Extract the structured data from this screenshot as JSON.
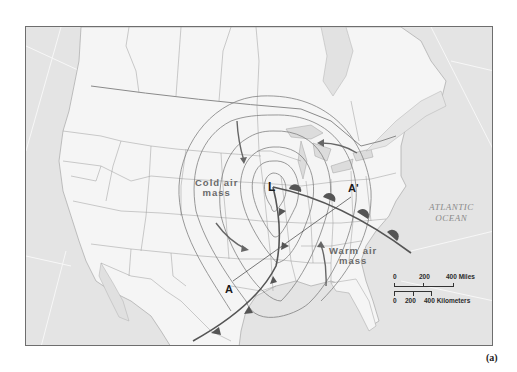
{
  "figure": {
    "label": "(a)"
  },
  "map": {
    "type": "weather-map",
    "region": "North America",
    "pressure_center": {
      "symbol": "L",
      "label": "L"
    },
    "air_masses": {
      "cold": {
        "line1": "Cold air",
        "line2": "mass"
      },
      "warm": {
        "line1": "Warm air",
        "line2": "mass"
      }
    },
    "ocean": {
      "line1": "ATLANTIC",
      "line2": "OCEAN"
    },
    "cross_section": {
      "start": "A",
      "end": "A'"
    },
    "fronts": [
      {
        "type": "warm-front",
        "symbol": "semicircles"
      },
      {
        "type": "cold-front",
        "symbol": "triangles"
      }
    ],
    "isobar_count": 5,
    "colors": {
      "land": "#f4f4f4",
      "water": "#e2e2e2",
      "borders": "#8c8c8c",
      "isobars": "#7a7a7a",
      "fronts": "#5a5a5a",
      "arrows": "#666666"
    }
  },
  "scale_bar": {
    "miles": {
      "ticks": [
        "0",
        "200",
        "400 Miles"
      ]
    },
    "kilometers": {
      "ticks": [
        "0",
        "200",
        "400 Kilometers"
      ]
    }
  }
}
